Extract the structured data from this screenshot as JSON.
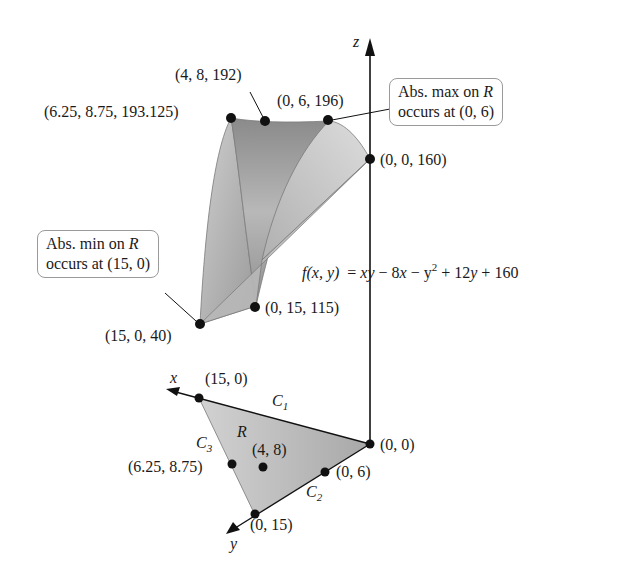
{
  "figure": {
    "function_label": {
      "lhs": "f(x, y)",
      "eq": "=",
      "rhs_parts": [
        "xy",
        " − 8",
        "x",
        " − y",
        "2",
        " + 12",
        "y",
        " + 160"
      ]
    },
    "axes": {
      "z": "z",
      "x": "x",
      "y": "y"
    },
    "surface_points": [
      {
        "label": "(4, 8, 192)"
      },
      {
        "label": "(6.25, 8.75, 193.125)"
      },
      {
        "label": "(0, 6, 196)"
      },
      {
        "label": "(0, 0, 160)"
      },
      {
        "label": "(0, 15, 115)"
      },
      {
        "label": "(15, 0, 40)"
      }
    ],
    "callouts": {
      "max": {
        "line1_prefix": "Abs. max on ",
        "line1_var": "R",
        "line2": "occurs at (0, 6)"
      },
      "min": {
        "line1_prefix": "Abs. min on ",
        "line1_var": "R",
        "line2": "occurs at (15, 0)"
      }
    },
    "region": {
      "name": "R",
      "curves": {
        "c1": "C",
        "c1_sub": "1",
        "c2": "C",
        "c2_sub": "2",
        "c3": "C",
        "c3_sub": "3"
      },
      "points": [
        {
          "label": "(15, 0)"
        },
        {
          "label": "(0, 0)"
        },
        {
          "label": "(4, 8)"
        },
        {
          "label": "(6.25, 8.75)"
        },
        {
          "label": "(0, 6)"
        },
        {
          "label": "(0, 15)"
        }
      ]
    },
    "colors": {
      "surface_dark": "#8c8c8c",
      "surface_mid": "#b5b5b5",
      "surface_light": "#d8d8d8",
      "region_fill": "#c4c4c4",
      "ink": "#111111"
    }
  }
}
